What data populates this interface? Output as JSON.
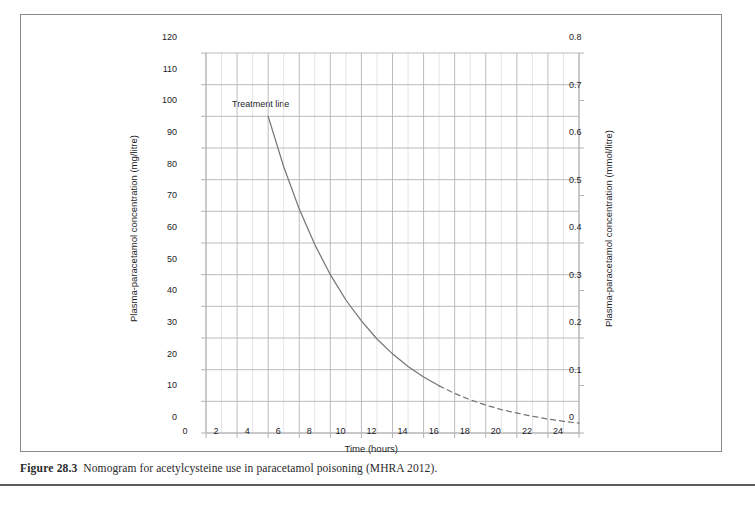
{
  "figure": {
    "caption_number": "Figure 28.3",
    "caption_text": "Nomogram for acetylcysteine use in paracetamol poisoning (MHRA 2012)."
  },
  "annotations": {
    "treatment_line_label": "Treatment line"
  },
  "colors": {
    "curve": "#76767a",
    "grid_minor": "#d8d8dc",
    "grid_major": "#b4b4b8",
    "frame": "#8a8a8e",
    "text": "#1d1d1f",
    "caption_rule": "#5c5c60"
  },
  "chart_data": {
    "type": "line",
    "title": "",
    "subtitle": "",
    "xlabel": "Time (hours)",
    "ylabel": "Plasma-paracetamol concentration (mg/litre)",
    "y2label": "Plasma-paracetamol concentration (mmol/litre)",
    "xlim": [
      0,
      24
    ],
    "ylim": [
      0,
      120
    ],
    "y2lim": [
      0,
      0.8
    ],
    "xticks": [
      0,
      2,
      4,
      6,
      8,
      10,
      12,
      14,
      16,
      18,
      20,
      22,
      24
    ],
    "xticklabels": [
      "0",
      "2",
      "4",
      "6",
      "8",
      "10",
      "12",
      "14",
      "16",
      "18",
      "20",
      "22",
      "24"
    ],
    "yticks": [
      0,
      10,
      20,
      30,
      40,
      50,
      60,
      70,
      80,
      90,
      100,
      110,
      120
    ],
    "yticklabels": [
      "0",
      "10",
      "20",
      "30",
      "40",
      "50",
      "60",
      "70",
      "80",
      "90",
      "100",
      "110",
      "120"
    ],
    "y2ticks": [
      0,
      0.1,
      0.2,
      0.3,
      0.4,
      0.5,
      0.6,
      0.7,
      0.8
    ],
    "y2ticklabels": [
      "0",
      "0.1",
      "0.2",
      "0.3",
      "0.4",
      "0.5",
      "0.6",
      "0.7",
      "0.8"
    ],
    "grid": true,
    "grid_minor_x_step": 1,
    "legend": "none",
    "series": [
      {
        "name": "Treatment line",
        "style": "solid",
        "x": [
          4,
          5,
          6,
          7,
          8,
          9,
          10,
          11,
          12,
          13,
          14,
          15
        ],
        "values": [
          100,
          84.1,
          70.7,
          59.5,
          50.0,
          42.0,
          35.4,
          29.7,
          25.0,
          21.0,
          17.7,
          14.9
        ]
      },
      {
        "name": "Treatment line (extrapolated)",
        "style": "dashed",
        "x": [
          15,
          16,
          17,
          18,
          19,
          20,
          21,
          22,
          23,
          24
        ],
        "values": [
          14.9,
          12.5,
          10.5,
          8.8,
          7.4,
          6.3,
          5.3,
          4.4,
          3.7,
          3.1
        ]
      }
    ]
  }
}
